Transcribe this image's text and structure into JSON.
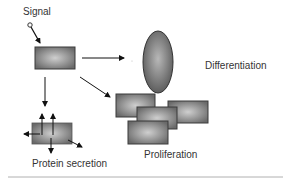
{
  "labels": {
    "signal": "Signal",
    "differentiation": "Differentiation",
    "protein_secretion": "Protein secretion",
    "proliferation": "Proliferation"
  },
  "colors": {
    "cell_center": "#c8c8c8",
    "cell_edge": "#6e6e6e",
    "cell_border": "#3a3a3a",
    "arrow": "#111111",
    "rule": "#b0b0b0"
  },
  "nodes": [
    {
      "id": "signal",
      "shape": "small-circle",
      "label": "Signal"
    },
    {
      "id": "cell",
      "shape": "rectangle"
    },
    {
      "id": "differentiation",
      "shape": "ellipse",
      "label": "Differentiation"
    },
    {
      "id": "protein-secretion",
      "shape": "rectangle",
      "label": "Protein secretion"
    },
    {
      "id": "proliferation",
      "shape": "rectangle-cluster",
      "count": 4,
      "label": "Proliferation"
    }
  ],
  "edges": [
    {
      "from": "signal",
      "to": "cell"
    },
    {
      "from": "cell",
      "to": "differentiation"
    },
    {
      "from": "cell",
      "to": "protein-secretion"
    },
    {
      "from": "cell",
      "to": "proliferation"
    }
  ]
}
